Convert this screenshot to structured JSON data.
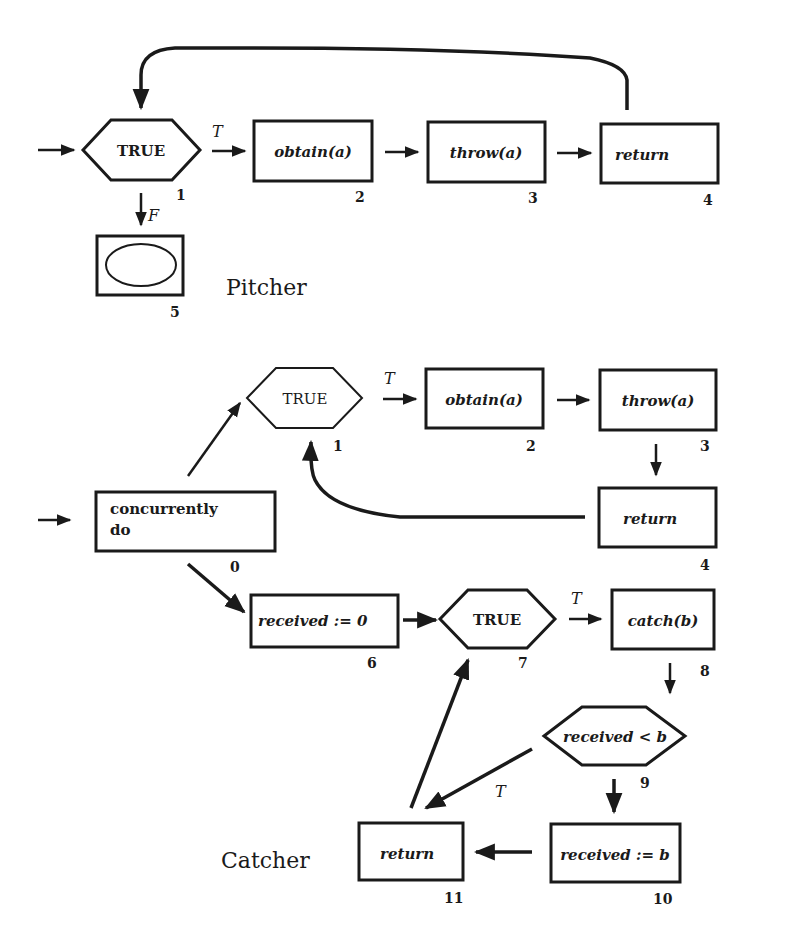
{
  "pitcher": {
    "caption": "Pitcher",
    "nodes": [
      {
        "id": "1",
        "type": "decision",
        "label": "TRUE",
        "number": "1"
      },
      {
        "id": "2",
        "type": "process",
        "label": "obtain(a)",
        "number": "2"
      },
      {
        "id": "3",
        "type": "process",
        "label": "throw(a)",
        "number": "3"
      },
      {
        "id": "4",
        "type": "process",
        "label": "return",
        "number": "4"
      },
      {
        "id": "5",
        "type": "terminal",
        "label": "",
        "number": "5"
      }
    ],
    "edges": [
      {
        "from": "start",
        "to": "1",
        "label": ""
      },
      {
        "from": "1",
        "to": "2",
        "label": "T"
      },
      {
        "from": "2",
        "to": "3",
        "label": ""
      },
      {
        "from": "3",
        "to": "4",
        "label": ""
      },
      {
        "from": "4",
        "to": "1",
        "label": ""
      },
      {
        "from": "1",
        "to": "5",
        "label": "F"
      }
    ]
  },
  "catcher": {
    "caption": "Catcher",
    "nodes": [
      {
        "id": "0",
        "type": "process",
        "label_line1": "concurrently",
        "label_line2": "do",
        "number": "0"
      },
      {
        "id": "1",
        "type": "decision",
        "label": "TRUE",
        "number": "1"
      },
      {
        "id": "2",
        "type": "process",
        "label": "obtain(a)",
        "number": "2"
      },
      {
        "id": "3",
        "type": "process",
        "label": "throw(a)",
        "number": "3"
      },
      {
        "id": "4",
        "type": "process",
        "label": "return",
        "number": "4"
      },
      {
        "id": "6",
        "type": "process",
        "label": "received := 0",
        "number": "6"
      },
      {
        "id": "7",
        "type": "decision",
        "label": "TRUE",
        "number": "7"
      },
      {
        "id": "8",
        "type": "process",
        "label": "catch(b)",
        "number": "8"
      },
      {
        "id": "9",
        "type": "decision",
        "label": "received < b",
        "number": "9"
      },
      {
        "id": "10",
        "type": "process",
        "label": "received := b",
        "number": "10"
      },
      {
        "id": "11",
        "type": "process",
        "label": "return",
        "number": "11"
      }
    ],
    "edges": [
      {
        "from": "start",
        "to": "0",
        "label": ""
      },
      {
        "from": "0",
        "to": "1",
        "label": ""
      },
      {
        "from": "1",
        "to": "2",
        "label": "T"
      },
      {
        "from": "2",
        "to": "3",
        "label": ""
      },
      {
        "from": "3",
        "to": "4",
        "label": ""
      },
      {
        "from": "4",
        "to": "1",
        "label": ""
      },
      {
        "from": "0",
        "to": "6",
        "label": ""
      },
      {
        "from": "6",
        "to": "7",
        "label": ""
      },
      {
        "from": "7",
        "to": "8",
        "label": "T"
      },
      {
        "from": "8",
        "to": "9",
        "label": ""
      },
      {
        "from": "9",
        "to": "10",
        "label": "T"
      },
      {
        "from": "9",
        "to": "11",
        "label": "F"
      },
      {
        "from": "10",
        "to": "11",
        "label": ""
      },
      {
        "from": "11",
        "to": "7",
        "label": ""
      }
    ]
  },
  "edge_labels": {
    "true": "T",
    "false": "F"
  }
}
